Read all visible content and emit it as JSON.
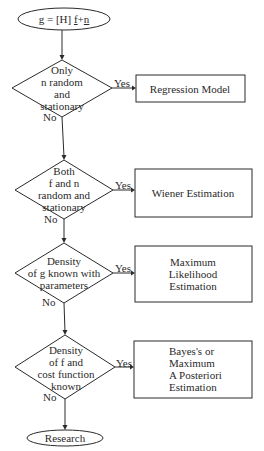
{
  "diagram": {
    "start": {
      "parts": [
        {
          "text": "g",
          "underline": true
        },
        {
          "text": " = [H] ",
          "underline": false
        },
        {
          "text": "f",
          "underline": true
        },
        {
          "text": "+",
          "underline": false
        },
        {
          "text": "n",
          "underline": true
        }
      ]
    },
    "decisions": [
      {
        "lines": [
          "Only",
          "n random",
          "and",
          "stationary"
        ],
        "yes_label": "Yes",
        "no_label": "No",
        "outcome": [
          "Regression Model"
        ]
      },
      {
        "lines": [
          "Both",
          "f and n",
          "random and",
          "stationary"
        ],
        "yes_label": "Yes",
        "no_label": "No",
        "outcome": [
          "Wiener Estimation"
        ]
      },
      {
        "lines": [
          "Density",
          "of g known with",
          "parameters"
        ],
        "yes_label": "Yes",
        "no_label": "No",
        "outcome": [
          "Maximum",
          "Likelihood",
          "Estimation"
        ]
      },
      {
        "lines": [
          "Density",
          "of f and",
          "cost function",
          "known"
        ],
        "yes_label": "Yes",
        "no_label": "No",
        "outcome": [
          "Bayes's or",
          "Maximum",
          "A Posteriori",
          "Estimation"
        ]
      }
    ],
    "end": {
      "label": "Research"
    }
  }
}
